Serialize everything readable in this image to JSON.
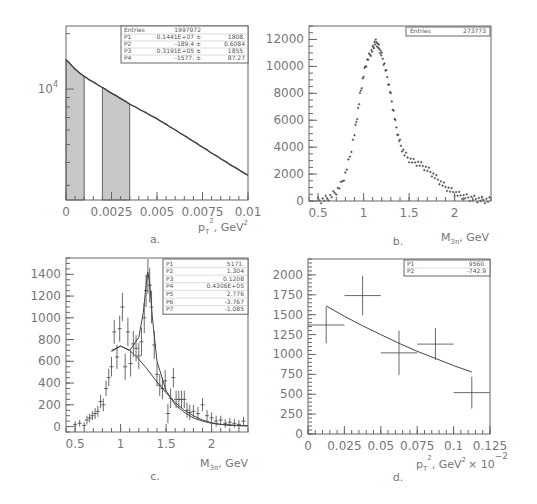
{
  "chart_data": [
    {
      "id": "a",
      "type": "line",
      "caption": "a.",
      "title": "",
      "xlabel": "p_T^2, GeV^2",
      "ylabel": "",
      "xlim": [
        0,
        0.01
      ],
      "ylog": true,
      "xticks": [
        "0",
        "0.0025",
        "0.005",
        "0.0075",
        "0.01"
      ],
      "yticks_labeled": [
        "10^4"
      ],
      "grid": false,
      "shaded_regions": [
        [
          0,
          0.001
        ],
        [
          0.002,
          0.0035
        ]
      ],
      "stats_box": {
        "rows": [
          [
            "Entries",
            "1997972",
            ""
          ],
          [
            "P1",
            "0.1441E+07 ±",
            "1808."
          ],
          [
            "P2",
            "-189.4 ±",
            "0.6084"
          ],
          [
            "P3",
            "0.3191E+05 ±",
            "1855."
          ],
          [
            "P4",
            "-1577. ±",
            "87.27"
          ]
        ]
      },
      "series": [
        {
          "name": "histogram + fit",
          "x": [
            0,
            0.0005,
            0.001,
            0.0015,
            0.002,
            0.0025,
            0.003,
            0.0035,
            0.004,
            0.005,
            0.006,
            0.007,
            0.008,
            0.009,
            0.01
          ],
          "y": [
            14500,
            12800,
            11700,
            10900,
            10200,
            9500,
            8900,
            8300,
            7800,
            6900,
            6000,
            5200,
            4500,
            3900,
            3400
          ]
        }
      ]
    },
    {
      "id": "b",
      "type": "scatter",
      "caption": "b.",
      "title": "",
      "xlabel": "M_3π, GeV",
      "ylabel": "",
      "xlim": [
        0.4,
        2.4
      ],
      "ylim": [
        0,
        13000
      ],
      "xticks": [
        "0.5",
        "1",
        "1.5",
        "2"
      ],
      "yticks": [
        "0",
        "2000",
        "4000",
        "6000",
        "8000",
        "10000",
        "12000"
      ],
      "grid": false,
      "stats_box": {
        "rows": [
          [
            "Entries",
            "273773"
          ]
        ]
      },
      "series": [
        {
          "name": "events",
          "x": [
            0.5,
            0.55,
            0.6,
            0.65,
            0.7,
            0.75,
            0.8,
            0.85,
            0.9,
            0.93,
            0.96,
            0.99,
            1.02,
            1.05,
            1.08,
            1.1,
            1.12,
            1.14,
            1.16,
            1.18,
            1.2,
            1.23,
            1.26,
            1.29,
            1.32,
            1.35,
            1.38,
            1.41,
            1.45,
            1.5,
            1.55,
            1.6,
            1.65,
            1.7,
            1.75,
            1.8,
            1.85,
            1.9,
            1.95,
            2.0,
            2.05,
            2.1,
            2.15,
            2.2,
            2.25,
            2.3,
            2.35,
            2.4
          ],
          "y": [
            20,
            80,
            200,
            400,
            700,
            1200,
            2000,
            3300,
            5000,
            6300,
            7800,
            9000,
            10000,
            10600,
            11000,
            11300,
            11700,
            11800,
            11500,
            11200,
            10800,
            10100,
            9200,
            8200,
            7000,
            5800,
            4800,
            4100,
            3500,
            3100,
            2900,
            2800,
            2600,
            2350,
            2050,
            1700,
            1350,
            1050,
            800,
            600,
            450,
            330,
            250,
            180,
            130,
            90,
            60,
            40
          ]
        }
      ]
    },
    {
      "id": "c",
      "type": "scatter",
      "caption": "c.",
      "title": "",
      "xlabel": "M_3π, GeV",
      "ylabel": "",
      "xlim": [
        0.4,
        2.4
      ],
      "ylim": [
        -50,
        1550
      ],
      "xticks": [
        "0.5",
        "1",
        "1.5",
        "2"
      ],
      "yticks": [
        "0",
        "200",
        "400",
        "600",
        "800",
        "1000",
        "1200",
        "1400"
      ],
      "grid": false,
      "stats_box": {
        "rows": [
          [
            "P1",
            "5171."
          ],
          [
            "P2",
            "1.304"
          ],
          [
            "P3",
            "0.1208"
          ],
          [
            "P4",
            "0.4306E+05"
          ],
          [
            "P5",
            "2.776"
          ],
          [
            "P6",
            "-3.767"
          ],
          [
            "P7",
            "-1.085"
          ]
        ]
      },
      "series": [
        {
          "name": "data",
          "x": [
            0.5,
            0.55,
            0.6,
            0.63,
            0.66,
            0.69,
            0.72,
            0.75,
            0.78,
            0.81,
            0.84,
            0.87,
            0.9,
            0.93,
            0.96,
            0.99,
            1.02,
            1.05,
            1.08,
            1.11,
            1.14,
            1.17,
            1.2,
            1.23,
            1.26,
            1.28,
            1.3,
            1.32,
            1.34,
            1.37,
            1.4,
            1.43,
            1.46,
            1.49,
            1.52,
            1.55,
            1.58,
            1.61,
            1.64,
            1.67,
            1.7,
            1.73,
            1.76,
            1.8,
            1.85,
            1.9,
            1.95,
            2.0,
            2.05,
            2.1,
            2.15,
            2.2,
            2.25,
            2.3,
            2.35
          ],
          "y": [
            20,
            30,
            10,
            60,
            80,
            100,
            120,
            140,
            230,
            200,
            350,
            450,
            550,
            870,
            640,
            900,
            1100,
            550,
            870,
            580,
            760,
            720,
            650,
            780,
            1000,
            1250,
            1380,
            1300,
            1100,
            750,
            480,
            380,
            350,
            420,
            120,
            260,
            450,
            250,
            250,
            250,
            250,
            150,
            130,
            140,
            120,
            200,
            100,
            80,
            50,
            60,
            30,
            40,
            30,
            20,
            50
          ],
          "yerr": [
            30,
            30,
            30,
            40,
            40,
            40,
            50,
            50,
            60,
            60,
            70,
            80,
            90,
            110,
            110,
            120,
            130,
            120,
            130,
            120,
            120,
            120,
            120,
            130,
            140,
            150,
            160,
            160,
            150,
            130,
            110,
            100,
            100,
            100,
            90,
            90,
            90,
            80,
            80,
            80,
            80,
            70,
            70,
            60,
            60,
            60,
            50,
            50,
            50,
            40,
            40,
            40,
            40,
            40,
            40
          ]
        },
        {
          "name": "fit total",
          "x": [
            0.9,
            1.0,
            1.1,
            1.2,
            1.25,
            1.28,
            1.3,
            1.32,
            1.35,
            1.4,
            1.5,
            1.6,
            1.7,
            1.8,
            1.9,
            2.0,
            2.1,
            2.2,
            2.3,
            2.4
          ],
          "y": [
            690,
            740,
            700,
            820,
            1050,
            1300,
            1420,
            1320,
            1000,
            600,
            330,
            200,
            130,
            80,
            50,
            30,
            20,
            15,
            10,
            8
          ]
        },
        {
          "name": "fit background",
          "x": [
            0.9,
            1.0,
            1.1,
            1.2,
            1.3,
            1.4,
            1.5,
            1.6,
            1.7,
            1.8,
            1.9,
            2.0,
            2.1,
            2.2,
            2.3,
            2.4
          ],
          "y": [
            700,
            740,
            700,
            620,
            520,
            410,
            310,
            220,
            150,
            100,
            60,
            35,
            20,
            12,
            8,
            5
          ]
        }
      ]
    },
    {
      "id": "d",
      "type": "scatter",
      "caption": "d.",
      "title": "",
      "xlabel": "p_T^2, GeV^2",
      "x_multiplier": "× 10^-2",
      "ylabel": "",
      "xlim": [
        0,
        0.125
      ],
      "ylim": [
        0,
        2200
      ],
      "xticks": [
        "0",
        "0.025",
        "0.05",
        "0.075",
        "0.1",
        "0.125"
      ],
      "yticks": [
        "0",
        "250",
        "500",
        "750",
        "1000",
        "1250",
        "1500",
        "1750",
        "2000"
      ],
      "grid": false,
      "stats_box": {
        "rows": [
          [
            "P1",
            "9560."
          ],
          [
            "P2",
            "-742.9"
          ]
        ]
      },
      "series": [
        {
          "name": "data",
          "x": [
            0.0125,
            0.0375,
            0.0625,
            0.0875,
            0.1125
          ],
          "y": [
            1370,
            1740,
            1020,
            1130,
            520
          ],
          "xerr": [
            0.0125,
            0.0125,
            0.0125,
            0.0125,
            0.0125
          ],
          "yerr": [
            230,
            250,
            280,
            200,
            200
          ]
        },
        {
          "name": "fit",
          "x": [
            0.0125,
            0.025,
            0.0375,
            0.05,
            0.0625,
            0.075,
            0.0875,
            0.1,
            0.1125
          ],
          "y": [
            1610,
            1480,
            1360,
            1250,
            1140,
            1040,
            950,
            860,
            780
          ]
        }
      ]
    }
  ],
  "panels": {
    "a": {
      "caption": "a.",
      "x_title_main": "p",
      "x_title_sub": "T",
      "x_title_sup": "2",
      "x_title_rest": ",  GeV",
      "x_title_unit_sup": "2",
      "y_tick_main": "10",
      "y_tick_sup": "4"
    },
    "b": {
      "caption": "b.",
      "x_title_main": "M",
      "x_title_sub": "3π",
      "x_title_rest": ",  GeV"
    },
    "c": {
      "caption": "c.",
      "x_title_main": "M",
      "x_title_sub": "3π",
      "x_title_rest": ",  GeV"
    },
    "d": {
      "caption": "d.",
      "x_title_main": "p",
      "x_title_sub": "T",
      "x_title_sup": "2",
      "x_title_rest": ",  GeV",
      "x_title_unit_sup": "2",
      "multiplier_main": "× 10",
      "multiplier_sup": "−2"
    }
  },
  "colors": {
    "frame": "#666666",
    "line": "#444444",
    "shade": "#c8c8c8",
    "text": "#777777"
  }
}
